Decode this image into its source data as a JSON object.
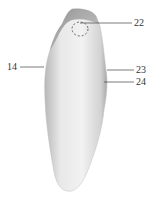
{
  "figure": {
    "labels": [
      {
        "id": "22",
        "text": "22"
      },
      {
        "id": "14",
        "text": "14"
      },
      {
        "id": "23",
        "text": "23"
      },
      {
        "id": "24",
        "text": "24"
      }
    ],
    "colors": {
      "body": "#e6e6e6",
      "shadow": "#9a9a9a",
      "highlight": "#f7f7f7",
      "text": "#333333"
    }
  }
}
